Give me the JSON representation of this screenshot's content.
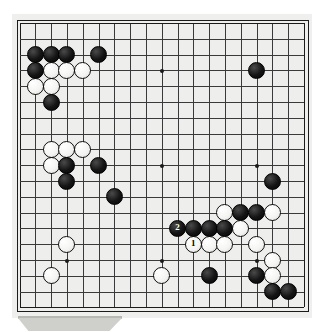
{
  "board": {
    "title": "Go board diagram",
    "size": 19,
    "grid": {
      "origin_x": 18.5,
      "origin_y": 22.0,
      "spacing": 15.8,
      "line_color": "#3a3a3a",
      "border_color": "#1b1b1b",
      "background_color": "#eeeeec"
    },
    "star_points": [
      {
        "col": 3,
        "row": 3
      },
      {
        "col": 9,
        "row": 3
      },
      {
        "col": 15,
        "row": 3
      },
      {
        "col": 3,
        "row": 9
      },
      {
        "col": 9,
        "row": 9
      },
      {
        "col": 15,
        "row": 9
      },
      {
        "col": 3,
        "row": 15
      },
      {
        "col": 9,
        "row": 15
      },
      {
        "col": 15,
        "row": 15
      }
    ],
    "stones": [
      {
        "col": 1,
        "row": 2,
        "color": "black",
        "label": ""
      },
      {
        "col": 2,
        "row": 2,
        "color": "black",
        "label": ""
      },
      {
        "col": 3,
        "row": 2,
        "color": "black",
        "label": ""
      },
      {
        "col": 5,
        "row": 2,
        "color": "black",
        "label": ""
      },
      {
        "col": 15,
        "row": 3,
        "color": "black",
        "label": ""
      },
      {
        "col": 1,
        "row": 3,
        "color": "black",
        "label": ""
      },
      {
        "col": 2,
        "row": 3,
        "color": "white",
        "label": ""
      },
      {
        "col": 3,
        "row": 3,
        "color": "white",
        "label": ""
      },
      {
        "col": 4,
        "row": 3,
        "color": "white",
        "label": ""
      },
      {
        "col": 1,
        "row": 4,
        "color": "white",
        "label": ""
      },
      {
        "col": 2,
        "row": 4,
        "color": "white",
        "label": ""
      },
      {
        "col": 2,
        "row": 5,
        "color": "black",
        "label": ""
      },
      {
        "col": 2,
        "row": 8,
        "color": "white",
        "label": ""
      },
      {
        "col": 3,
        "row": 8,
        "color": "white",
        "label": ""
      },
      {
        "col": 4,
        "row": 8,
        "color": "white",
        "label": ""
      },
      {
        "col": 2,
        "row": 9,
        "color": "white",
        "label": ""
      },
      {
        "col": 3,
        "row": 9,
        "color": "black",
        "label": ""
      },
      {
        "col": 5,
        "row": 9,
        "color": "black",
        "label": ""
      },
      {
        "col": 3,
        "row": 10,
        "color": "black",
        "label": ""
      },
      {
        "col": 6,
        "row": 11,
        "color": "black",
        "label": ""
      },
      {
        "col": 16,
        "row": 10,
        "color": "black",
        "label": ""
      },
      {
        "col": 13,
        "row": 12,
        "color": "white",
        "label": ""
      },
      {
        "col": 14,
        "row": 12,
        "color": "black",
        "label": ""
      },
      {
        "col": 15,
        "row": 12,
        "color": "black",
        "label": ""
      },
      {
        "col": 16,
        "row": 12,
        "color": "white",
        "label": ""
      },
      {
        "col": 10,
        "row": 13,
        "color": "black",
        "label": "2"
      },
      {
        "col": 11,
        "row": 13,
        "color": "black",
        "label": ""
      },
      {
        "col": 12,
        "row": 13,
        "color": "black",
        "label": ""
      },
      {
        "col": 13,
        "row": 13,
        "color": "black",
        "label": ""
      },
      {
        "col": 14,
        "row": 13,
        "color": "white",
        "label": ""
      },
      {
        "col": 11,
        "row": 14,
        "color": "white",
        "label": "1"
      },
      {
        "col": 12,
        "row": 14,
        "color": "white",
        "label": ""
      },
      {
        "col": 13,
        "row": 14,
        "color": "white",
        "label": ""
      },
      {
        "col": 15,
        "row": 14,
        "color": "white",
        "label": ""
      },
      {
        "col": 3,
        "row": 14,
        "color": "white",
        "label": ""
      },
      {
        "col": 16,
        "row": 15,
        "color": "white",
        "label": ""
      },
      {
        "col": 2,
        "row": 16,
        "color": "white",
        "label": ""
      },
      {
        "col": 9,
        "row": 16,
        "color": "white",
        "label": ""
      },
      {
        "col": 12,
        "row": 16,
        "color": "black",
        "label": ""
      },
      {
        "col": 15,
        "row": 16,
        "color": "black",
        "label": ""
      },
      {
        "col": 16,
        "row": 16,
        "color": "white",
        "label": ""
      },
      {
        "col": 16,
        "row": 17,
        "color": "black",
        "label": ""
      },
      {
        "col": 17,
        "row": 17,
        "color": "black",
        "label": ""
      }
    ],
    "move_markers": [
      {
        "number": "1",
        "color": "white",
        "col": 11,
        "row": 14
      },
      {
        "number": "2",
        "color": "black",
        "col": 10,
        "row": 13
      }
    ]
  }
}
